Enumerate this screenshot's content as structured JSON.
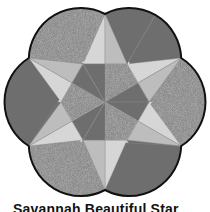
{
  "figure": {
    "caption": "Savannah Beautiful Star",
    "colors": {
      "star_light": "#d6d6d6",
      "star_mid": "#bdbdbd",
      "dark_solid": "#6e6e6e",
      "dark_speckled": "#7a7a7a",
      "outline": "#111111"
    }
  }
}
